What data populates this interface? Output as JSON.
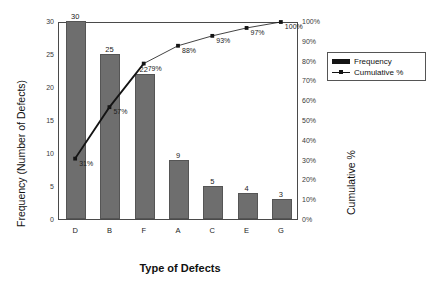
{
  "chart_data": {
    "type": "bar",
    "title": "",
    "subtitle": "",
    "categories": [
      "D",
      "B",
      "F",
      "A",
      "C",
      "E",
      "G"
    ],
    "xlabel": "Type of Defects",
    "ylabel": "Frequency (Number of Defects)",
    "y2label": "Cumulative %",
    "ylim": [
      0,
      30
    ],
    "y2lim": [
      0,
      100
    ],
    "grid": false,
    "legend_position": "right",
    "series": [
      {
        "name": "Frequency",
        "type": "bar",
        "color": "#6e6e6e",
        "axis": "left",
        "values": [
          30,
          25,
          22,
          9,
          5,
          4,
          3
        ],
        "data_labels": [
          "30",
          "25",
          "22",
          "9",
          "5",
          "4",
          "3"
        ]
      },
      {
        "name": "Cumulative %",
        "type": "line",
        "color": "#141414",
        "axis": "right",
        "values": [
          31,
          57,
          79,
          88,
          93,
          97,
          100
        ],
        "data_labels": [
          "31%",
          "57%",
          "79%",
          "88%",
          "93%",
          "97%",
          "100%"
        ]
      }
    ],
    "yticks": [
      0,
      5,
      10,
      15,
      20,
      25,
      30
    ],
    "ytick_labels": [
      "0",
      "5",
      "10",
      "15",
      "20",
      "25",
      "30"
    ],
    "y2ticks": [
      0,
      10,
      20,
      30,
      40,
      50,
      60,
      70,
      80,
      90,
      100
    ],
    "y2tick_labels": [
      "0%",
      "10%",
      "20%",
      "30%",
      "40%",
      "50%",
      "60%",
      "70%",
      "80%",
      "90%",
      "100%"
    ]
  },
  "axes": {
    "y_left_title": "Frequency (Number of Defects)",
    "y_right_title": "Cumulative %",
    "x_title": "Type of Defects"
  },
  "legend": {
    "items": [
      {
        "label": "Frequency",
        "marker": "bar-swatch-icon"
      },
      {
        "label": "Cumulative %",
        "marker": "line-marker-icon"
      }
    ]
  },
  "colors": {
    "bar_fill": "#6e6e6e",
    "bar_stroke": "#555555",
    "line": "#141414",
    "frame": "#4a4a4a",
    "background": "#ffffff"
  }
}
